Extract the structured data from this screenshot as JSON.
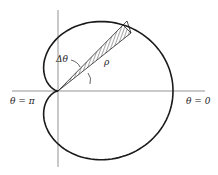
{
  "diagram": {
    "type": "polar-area-element",
    "curve": "cardioid-like closed curve with cusp at origin",
    "labels": {
      "left_axis": "θ = π",
      "right_axis": "θ = 0",
      "delta_theta": "Δθ",
      "rho": "ρ"
    },
    "colors": {
      "stroke": "#1a1a1a",
      "axis": "#555555"
    }
  }
}
